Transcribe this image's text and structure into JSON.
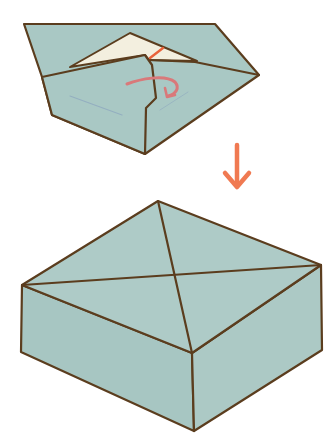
{
  "diagram": {
    "type": "origami-instruction",
    "steps": [
      {
        "id": "step-fold-flap",
        "description": "Tuck the flap inside, folding along the marked line",
        "fold_line_color": "#e8623a",
        "action_arrow": "curved-tuck-arrow"
      },
      {
        "id": "step-finished-box",
        "description": "Finished box with lid"
      }
    ],
    "transition_arrow": "down-arrow"
  },
  "colors": {
    "paper": "#a9c8c4",
    "paper_inside": "#f3efdf",
    "outline": "#5b3d1e",
    "fold_line": "#e8623a",
    "tuck_arrow": "#d9797a",
    "step_arrow": "#f07a52",
    "crease_hint": "#8fa9bf",
    "background": "#ffffff"
  }
}
